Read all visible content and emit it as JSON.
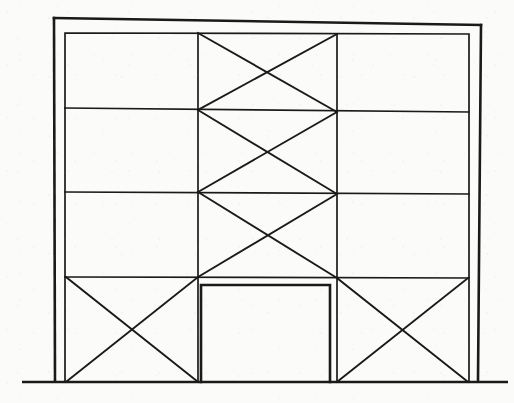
{
  "figure": {
    "type": "line-drawing",
    "background_color": "#fbfbfa",
    "ink_color": "#1a1a1a",
    "canvas": {
      "width": 514,
      "height": 403
    }
  },
  "geometry": {
    "outer_frame": {
      "label": "outer frame",
      "stroke_width": 2.6,
      "points": "54,18 481,25 478,381"
    },
    "outer_left_column": {
      "label": "outer left column",
      "x1": 54,
      "y1": 18,
      "x2": 55,
      "y2": 381,
      "stroke_width": 2.6
    },
    "outer_top_beam": {
      "label": "outer top beam",
      "x1": 54,
      "y1": 18,
      "x2": 481,
      "y2": 25,
      "stroke_width": 2.6
    },
    "outer_right_column": {
      "label": "outer right column",
      "x1": 481,
      "y1": 25,
      "x2": 478,
      "y2": 381,
      "stroke_width": 2.6
    },
    "inner_frame": {
      "label": "inner frame rectangle",
      "left": 65,
      "top": 33,
      "right": 469,
      "bottom": 382,
      "stroke_width": 1.7
    },
    "ground_line": {
      "label": "ground line",
      "x1": 22,
      "y1": 382,
      "x2": 508,
      "y2": 382,
      "stroke_width": 2.6
    },
    "floor_lines": [
      {
        "label": "floor level 4",
        "x1": 65,
        "y1": 108,
        "x2": 469,
        "y2": 112
      },
      {
        "label": "floor level 3",
        "x1": 65,
        "y1": 192,
        "x2": 469,
        "y2": 194
      },
      {
        "label": "floor level 2",
        "x1": 65,
        "y1": 277,
        "x2": 469,
        "y2": 278
      }
    ],
    "interior_columns": [
      {
        "label": "interior column left",
        "x1": 198,
        "y1": 33,
        "x2": 198,
        "y2": 382
      },
      {
        "label": "interior column right",
        "x1": 337,
        "y1": 34,
        "x2": 337,
        "y2": 382
      }
    ],
    "braces": [
      {
        "label": "center bay brace story4 a",
        "x1": 198,
        "y1": 33,
        "x2": 337,
        "y2": 112
      },
      {
        "label": "center bay brace story4 b",
        "x1": 337,
        "y1": 34,
        "x2": 198,
        "y2": 110
      },
      {
        "label": "center bay brace story3 a",
        "x1": 198,
        "y1": 110,
        "x2": 337,
        "y2": 194
      },
      {
        "label": "center bay brace story3 b",
        "x1": 337,
        "y1": 112,
        "x2": 198,
        "y2": 192
      },
      {
        "label": "center bay brace story2 a",
        "x1": 198,
        "y1": 192,
        "x2": 337,
        "y2": 278
      },
      {
        "label": "center bay brace story2 b",
        "x1": 337,
        "y1": 194,
        "x2": 198,
        "y2": 277
      },
      {
        "label": "left bay brace story1 a",
        "x1": 66,
        "y1": 277,
        "x2": 198,
        "y2": 382
      },
      {
        "label": "left bay brace story1 b",
        "x1": 198,
        "y1": 277,
        "x2": 66,
        "y2": 382
      },
      {
        "label": "right bay brace story1 a",
        "x1": 337,
        "y1": 278,
        "x2": 468,
        "y2": 382
      },
      {
        "label": "right bay brace story1 b",
        "x1": 468,
        "y1": 278,
        "x2": 337,
        "y2": 382
      }
    ],
    "door_opening": {
      "label": "door opening",
      "left": 201,
      "top": 285,
      "right": 330,
      "bottom": 382,
      "stroke_width": 2.6
    }
  },
  "structure_summary": {
    "stories": 4,
    "bays": 3,
    "center_bay_braced_stories": 3,
    "ground_floor_braced_bays": 2,
    "openings": 1
  }
}
